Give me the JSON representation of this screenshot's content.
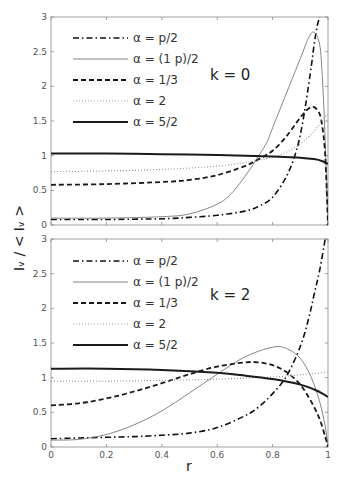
{
  "figure": {
    "ylabel": "Iᵥ / < Iᵥ >",
    "xlabel": "r"
  },
  "chart_data": [
    {
      "type": "line",
      "panel_label": "k = 0",
      "xlabel": "r",
      "ylabel": "I_v / <I_v>",
      "xlim": [
        0,
        1
      ],
      "ylim": [
        0,
        3
      ],
      "x_ticks": [
        "0",
        "0.2",
        "0.4",
        "0.6",
        "0.8",
        "1"
      ],
      "y_ticks": [
        "0",
        "0.5",
        "1",
        "1.5",
        "2",
        "2.5",
        "3"
      ],
      "grid": false,
      "legend_position": "upper left",
      "series": [
        {
          "name": "α = p/2",
          "style": "dash-dot",
          "x": [
            0,
            0.2,
            0.4,
            0.5,
            0.6,
            0.7,
            0.75,
            0.8,
            0.85,
            0.88,
            0.9,
            0.92,
            0.94,
            0.95,
            0.96,
            0.97
          ],
          "y": [
            0.08,
            0.08,
            0.09,
            0.11,
            0.14,
            0.2,
            0.27,
            0.4,
            0.7,
            1.0,
            1.3,
            1.75,
            2.3,
            2.6,
            2.85,
            3.0
          ]
        },
        {
          "name": "α = (1 p)/2",
          "style": "thin-solid",
          "x": [
            0,
            0.2,
            0.4,
            0.5,
            0.6,
            0.65,
            0.7,
            0.75,
            0.78,
            0.8,
            0.85,
            0.9,
            0.93,
            0.95,
            0.97,
            0.98,
            0.99,
            1.0
          ],
          "y": [
            0.1,
            0.1,
            0.12,
            0.16,
            0.3,
            0.45,
            0.7,
            1.0,
            1.2,
            1.4,
            1.9,
            2.4,
            2.7,
            2.78,
            2.6,
            2.1,
            1.2,
            0.0
          ]
        },
        {
          "name": "α = 1/3",
          "style": "dashed",
          "x": [
            0,
            0.2,
            0.4,
            0.5,
            0.6,
            0.7,
            0.75,
            0.8,
            0.85,
            0.9,
            0.93,
            0.95,
            0.97,
            0.98,
            0.99,
            1.0
          ],
          "y": [
            0.58,
            0.59,
            0.62,
            0.65,
            0.72,
            0.85,
            0.95,
            1.07,
            1.28,
            1.55,
            1.68,
            1.7,
            1.6,
            1.4,
            1.0,
            0.0
          ]
        },
        {
          "name": "α = 2",
          "style": "dotted",
          "x": [
            0,
            0.2,
            0.4,
            0.6,
            0.7,
            0.8,
            0.85,
            0.9,
            0.95,
            0.98,
            1.0
          ],
          "y": [
            0.77,
            0.78,
            0.8,
            0.85,
            0.9,
            0.98,
            1.05,
            1.17,
            1.35,
            1.52,
            1.6
          ]
        },
        {
          "name": "α = 5/2",
          "style": "thick-solid",
          "x": [
            0,
            0.2,
            0.4,
            0.6,
            0.8,
            0.9,
            0.95,
            0.98,
            1.0
          ],
          "y": [
            1.03,
            1.03,
            1.02,
            1.01,
            0.99,
            0.97,
            0.95,
            0.92,
            0.88
          ]
        }
      ]
    },
    {
      "type": "line",
      "panel_label": "k = 2",
      "xlabel": "r",
      "ylabel": "I_v / <I_v>",
      "xlim": [
        0,
        1
      ],
      "ylim": [
        0,
        3
      ],
      "x_ticks": [
        "0",
        "0.2",
        "0.4",
        "0.6",
        "0.8",
        "1"
      ],
      "y_ticks": [
        "0",
        "0.5",
        "1",
        "1.5",
        "2",
        "2.5",
        "3"
      ],
      "grid": false,
      "legend_position": "upper left",
      "series": [
        {
          "name": "α =   p/2",
          "style": "dash-dot",
          "x": [
            0,
            0.1,
            0.2,
            0.3,
            0.4,
            0.5,
            0.6,
            0.7,
            0.75,
            0.8,
            0.85,
            0.9,
            0.93,
            0.95,
            0.97,
            0.99
          ],
          "y": [
            0.12,
            0.13,
            0.14,
            0.15,
            0.17,
            0.2,
            0.28,
            0.45,
            0.58,
            0.77,
            1.02,
            1.45,
            1.85,
            2.2,
            2.55,
            3.0
          ]
        },
        {
          "name": "α = (1  p)/2",
          "style": "thin-solid",
          "x": [
            0,
            0.1,
            0.2,
            0.3,
            0.4,
            0.5,
            0.6,
            0.7,
            0.8,
            0.85,
            0.9,
            0.94,
            0.97,
            0.99,
            1.0
          ],
          "y": [
            0.1,
            0.11,
            0.18,
            0.32,
            0.52,
            0.78,
            1.05,
            1.3,
            1.44,
            1.42,
            1.28,
            1.0,
            0.65,
            0.3,
            0.0
          ]
        },
        {
          "name": "α = 1/3",
          "style": "dashed",
          "x": [
            0,
            0.1,
            0.2,
            0.3,
            0.4,
            0.5,
            0.6,
            0.7,
            0.75,
            0.8,
            0.85,
            0.9,
            0.94,
            0.97,
            0.99,
            1.0
          ],
          "y": [
            0.6,
            0.63,
            0.7,
            0.8,
            0.92,
            1.05,
            1.16,
            1.22,
            1.22,
            1.18,
            1.08,
            0.9,
            0.65,
            0.4,
            0.15,
            0.0
          ]
        },
        {
          "name": "α = 2",
          "style": "dotted",
          "x": [
            0,
            0.2,
            0.4,
            0.6,
            0.8,
            0.9,
            1.0
          ],
          "y": [
            0.95,
            0.95,
            0.96,
            0.98,
            1.01,
            1.04,
            1.08
          ]
        },
        {
          "name": "α = 5/2",
          "style": "thick-solid",
          "x": [
            0,
            0.2,
            0.4,
            0.6,
            0.7,
            0.8,
            0.9,
            0.95,
            0.98,
            1.0
          ],
          "y": [
            1.13,
            1.13,
            1.11,
            1.07,
            1.03,
            0.98,
            0.9,
            0.83,
            0.77,
            0.72
          ]
        }
      ]
    }
  ],
  "layout": {
    "plot_left": 51,
    "plot_right": 328,
    "panels": [
      {
        "top": 17,
        "bottom": 225,
        "legend_top": 38,
        "label_x": 210,
        "label_y": 80
      },
      {
        "top": 239,
        "bottom": 447,
        "legend_top": 261,
        "label_x": 210,
        "label_y": 300
      }
    ],
    "legend_line_x1": 73,
    "legend_line_x2": 128,
    "legend_text_x": 133,
    "legend_row_step": 21
  },
  "colors": {
    "axes": "#888888",
    "text": "#333333",
    "dash-dot": "#111111",
    "thin-solid": "#777777",
    "dashed": "#1a1a1a",
    "dotted": "#999999",
    "thick-solid": "#1a1a1a"
  },
  "line_styles": {
    "dash-dot": {
      "width": 1.6,
      "dash": "6,3,1.5,3"
    },
    "thin-solid": {
      "width": 0.9,
      "dash": ""
    },
    "dashed": {
      "width": 1.8,
      "dash": "5,3"
    },
    "dotted": {
      "width": 1.2,
      "dash": "1,2"
    },
    "thick-solid": {
      "width": 2.0,
      "dash": ""
    }
  }
}
